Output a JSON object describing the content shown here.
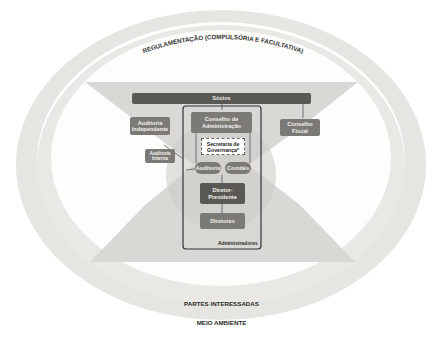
{
  "diagram": {
    "outer_ring_label_top": "REGULAMENTAÇÃO (COMPULSÓRIA E FACULTATIVA)",
    "inner_ring_label": "PARTES INTERESSADAS",
    "outer_ring_label_bottom": "MEIO AMBIENTE",
    "nodes": {
      "socios": "Sócios",
      "auditoria_independente": "Auditoria Independente",
      "conselho_administracao": "Conselho de Administração",
      "conselho_fiscal": "Conselho Fiscal",
      "auditoria_interna": "Auditoria Interna",
      "secretaria_governanca": "Secretaria de Governança*",
      "comite_auditoria": "Auditoria",
      "comites": "Comitês",
      "diretor_presidente": "Diretor-Presidente",
      "diretores": "Diretores",
      "administradores": "Administradores"
    },
    "colors": {
      "ring": "#e4e3df",
      "hourglass": "#d9d8d4",
      "dark_box": "#5a5855",
      "mid_box": "#7c7a77",
      "frame": "#333333"
    }
  }
}
